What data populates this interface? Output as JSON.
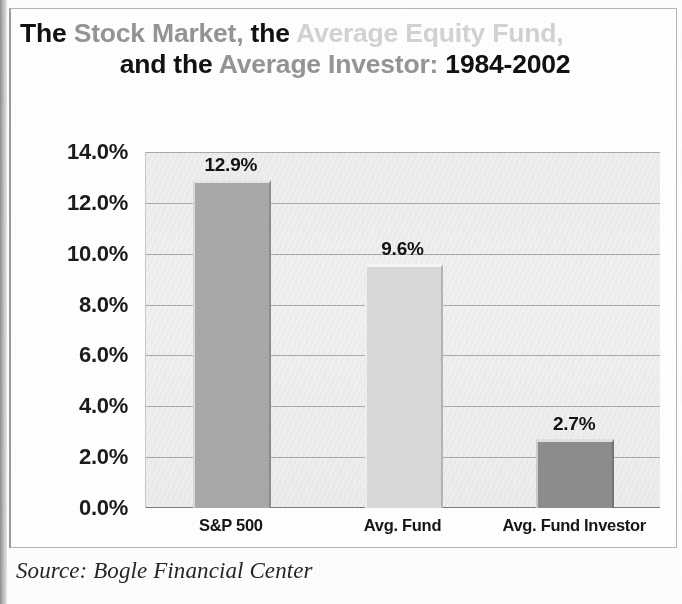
{
  "title": {
    "line1": [
      {
        "text": "The ",
        "tone": "black"
      },
      {
        "text": "Stock Market, ",
        "tone": "mid"
      },
      {
        "text": "the ",
        "tone": "black"
      },
      {
        "text": "Average Equity Fund,",
        "tone": "light"
      }
    ],
    "line2": [
      {
        "text": "and the ",
        "tone": "black"
      },
      {
        "text": "Average Investor: ",
        "tone": "mid"
      },
      {
        "text": "1984-2002",
        "tone": "black"
      }
    ],
    "plain": "The Stock Market, the Average Equity Fund, and the Average Investor: 1984-2002"
  },
  "source": {
    "text": "Source: Bogle Financial Center"
  },
  "colors": {
    "bar_sp500": "#a8a8a8",
    "bar_avg_fund": "#d8d8d8",
    "bar_avg_investor": "#8c8c8c",
    "plot_background": "#efefef",
    "gridline": "#8f8f8f",
    "title_black": "#111111",
    "title_mid": "#949494",
    "title_light": "#d2d2d2"
  },
  "chart_data": {
    "type": "bar",
    "title": "The Stock Market, the Average Equity Fund, and the Average Investor: 1984-2002",
    "xlabel": "",
    "ylabel": "",
    "categories": [
      "S&P 500",
      "Avg. Fund",
      "Avg. Fund Investor"
    ],
    "values": [
      12.9,
      9.6,
      2.7
    ],
    "value_labels": [
      "12.9%",
      "9.6%",
      "2.7%"
    ],
    "bar_colors": [
      "#a8a8a8",
      "#d8d8d8",
      "#8c8c8c"
    ],
    "ylim": [
      0,
      14
    ],
    "ytick_values": [
      14,
      12,
      10,
      8,
      6,
      4,
      2,
      0
    ],
    "ytick_labels": [
      "14.0%",
      "12.0%",
      "10.0%",
      "8.0%",
      "6.0%",
      "4.0%",
      "2.0%",
      "0.0%"
    ],
    "grid": true,
    "legend": false,
    "annotation": "Source: Bogle Financial Center"
  }
}
